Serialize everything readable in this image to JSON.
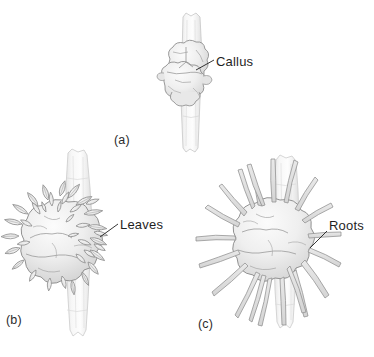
{
  "figure": {
    "background_color": "#ffffff",
    "ink_color": "#8d8d8d",
    "text_color": "#1f1f1f",
    "fill_light": "#f2f2f2",
    "fill_mid": "#e2e2e2",
    "fill_shadow": "#cfcfcf"
  },
  "panels": [
    {
      "id": "a",
      "label": "(a)",
      "description": "stem segment with undifferentiated callus mass",
      "callout": {
        "name": "callus",
        "label": "Callus",
        "text_x": 216,
        "text_y": 54
      }
    },
    {
      "id": "b",
      "label": "(b)",
      "description": "callus with leafy shoots developing",
      "callout": {
        "name": "leaves",
        "label": "Leaves",
        "text_x": 120,
        "text_y": 217
      }
    },
    {
      "id": "c",
      "label": "(c)",
      "description": "callus with roots developing",
      "callout": {
        "name": "roots",
        "label": "Roots",
        "text_x": 329,
        "text_y": 218
      }
    }
  ]
}
